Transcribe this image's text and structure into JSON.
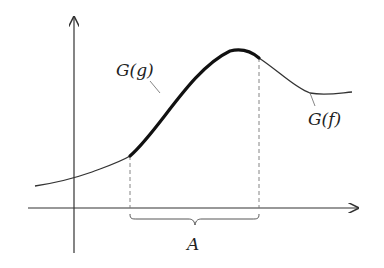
{
  "diagram": {
    "labels": {
      "graph_g": "G(g)",
      "graph_f": "G(f)",
      "interval": "A"
    },
    "colors": {
      "stroke": "#333333",
      "dashed": "#777777",
      "background": "#ffffff"
    }
  }
}
